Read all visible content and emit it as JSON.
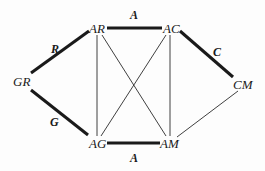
{
  "diagram": {
    "type": "graph",
    "nodes": [
      {
        "id": "AR",
        "label": "AR"
      },
      {
        "id": "AC",
        "label": "AC"
      },
      {
        "id": "GR",
        "label": "GR"
      },
      {
        "id": "CM",
        "label": "CM"
      },
      {
        "id": "AG",
        "label": "AG"
      },
      {
        "id": "AM",
        "label": "AM"
      }
    ],
    "edges": [
      {
        "from": "AR",
        "to": "AC",
        "label": "A",
        "weight": "thick"
      },
      {
        "from": "GR",
        "to": "AR",
        "label": "R",
        "weight": "thick"
      },
      {
        "from": "AC",
        "to": "CM",
        "label": "C",
        "weight": "thick"
      },
      {
        "from": "GR",
        "to": "AG",
        "label": "G",
        "weight": "thick"
      },
      {
        "from": "AG",
        "to": "AM",
        "label": "A",
        "weight": "thick"
      },
      {
        "from": "AR",
        "to": "AG",
        "label": "",
        "weight": "thin"
      },
      {
        "from": "AC",
        "to": "AM",
        "label": "",
        "weight": "thin"
      },
      {
        "from": "AR",
        "to": "AM",
        "label": "",
        "weight": "thin"
      },
      {
        "from": "AC",
        "to": "AG",
        "label": "",
        "weight": "thin"
      },
      {
        "from": "CM",
        "to": "AM",
        "label": "",
        "weight": "thin"
      }
    ],
    "labels": {
      "node_ar": "AR",
      "node_ac": "AC",
      "node_gr": "GR",
      "node_cm": "CM",
      "node_ag": "AG",
      "node_am": "AM",
      "edge_top": "A",
      "edge_left_upper": "R",
      "edge_right_upper": "C",
      "edge_left_lower": "G",
      "edge_bottom": "A"
    }
  }
}
